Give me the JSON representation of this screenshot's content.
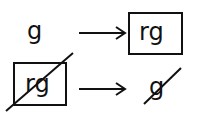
{
  "rows": [
    {
      "left": "g",
      "right": "rg",
      "left_boxed": false,
      "right_boxed": true,
      "left_struck": false,
      "right_struck": false
    },
    {
      "left": "rg",
      "right": "g",
      "left_boxed": true,
      "right_boxed": false,
      "left_struck": true,
      "right_struck": true
    }
  ],
  "arrow": "→"
}
